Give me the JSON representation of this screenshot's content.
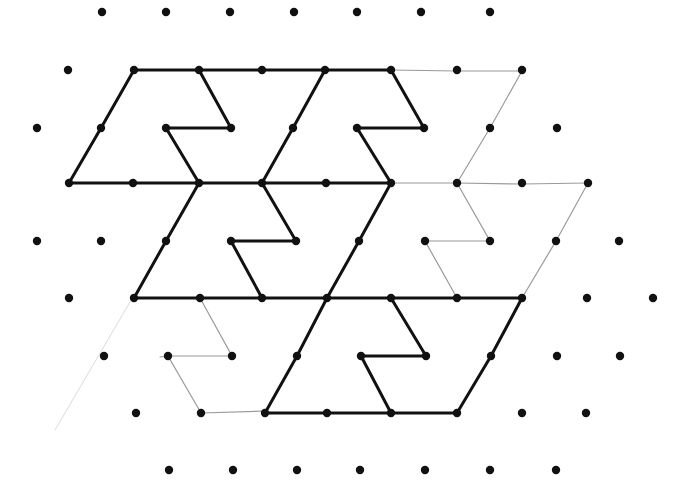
{
  "diagram": {
    "type": "isometric-dot-grid-tessellation",
    "background": "#ffffff",
    "colors": {
      "dot": "#111111",
      "bold_line": "#111111",
      "pencil_line": "#9a9a9a",
      "faint_line": "#dcdcdc"
    },
    "dot_radius": 4.2,
    "grid_rows": [
      {
        "y": 12,
        "x": [
          102,
          166,
          230,
          294,
          357,
          421,
          490
        ]
      },
      {
        "y": 70,
        "x": [
          68,
          134,
          199,
          262,
          325,
          391,
          457,
          522
        ]
      },
      {
        "y": 128,
        "x": [
          37,
          101,
          166,
          231,
          293,
          357,
          424,
          490,
          557
        ]
      },
      {
        "y": 183,
        "x": [
          69,
          133,
          199,
          262,
          326,
          391,
          457,
          522,
          588
        ]
      },
      {
        "y": 241,
        "x": [
          37,
          101,
          166,
          231,
          296,
          359,
          425,
          490,
          556,
          619
        ]
      },
      {
        "y": 298,
        "x": [
          69,
          134,
          200,
          262,
          327,
          391,
          457,
          522,
          587,
          653
        ]
      },
      {
        "y": 356,
        "x": [
          104,
          168,
          232,
          297,
          361,
          426,
          491,
          557,
          620
        ]
      },
      {
        "y": 413,
        "x": [
          136,
          201,
          265,
          327,
          391,
          457,
          522,
          586
        ]
      },
      {
        "y": 470,
        "x": [
          169,
          233,
          297,
          360,
          425,
          490,
          556
        ]
      }
    ],
    "bold_polylines": [
      {
        "name": "top-row-line",
        "points": [
          [
            134,
            70
          ],
          [
            391,
            70
          ]
        ]
      },
      {
        "name": "tile1-left-edge",
        "points": [
          [
            134,
            70
          ],
          [
            101,
            128
          ],
          [
            69,
            183
          ]
        ]
      },
      {
        "name": "tile1-notch",
        "points": [
          [
            199,
            70
          ],
          [
            231,
            128
          ],
          [
            166,
            128
          ],
          [
            199,
            183
          ]
        ]
      },
      {
        "name": "tile2-left-edge",
        "points": [
          [
            325,
            70
          ],
          [
            293,
            128
          ],
          [
            262,
            183
          ]
        ]
      },
      {
        "name": "tile2-notch",
        "points": [
          [
            391,
            70
          ],
          [
            424,
            128
          ],
          [
            357,
            128
          ],
          [
            391,
            183
          ]
        ]
      },
      {
        "name": "middle-row-line",
        "points": [
          [
            69,
            183
          ],
          [
            391,
            183
          ]
        ]
      },
      {
        "name": "tile3-left-edge",
        "points": [
          [
            199,
            183
          ],
          [
            166,
            241
          ],
          [
            134,
            298
          ]
        ]
      },
      {
        "name": "tile3-notch",
        "points": [
          [
            262,
            183
          ],
          [
            296,
            241
          ],
          [
            231,
            241
          ],
          [
            262,
            298
          ]
        ]
      },
      {
        "name": "tile4-left-edge",
        "points": [
          [
            391,
            183
          ],
          [
            359,
            241
          ],
          [
            327,
            298
          ]
        ]
      },
      {
        "name": "lower-row-line",
        "points": [
          [
            134,
            298
          ],
          [
            522,
            298
          ]
        ]
      },
      {
        "name": "tile5-left-edge",
        "points": [
          [
            327,
            298
          ],
          [
            297,
            356
          ],
          [
            265,
            413
          ]
        ]
      },
      {
        "name": "tile5-notch",
        "points": [
          [
            391,
            298
          ],
          [
            426,
            356
          ],
          [
            361,
            356
          ],
          [
            391,
            413
          ]
        ]
      },
      {
        "name": "tile5-right-edge",
        "points": [
          [
            522,
            298
          ],
          [
            491,
            356
          ],
          [
            457,
            413
          ]
        ]
      },
      {
        "name": "bottom-row-line",
        "points": [
          [
            265,
            413
          ],
          [
            457,
            413
          ]
        ]
      }
    ],
    "pencil_polylines": [
      {
        "name": "pencil-top-extension",
        "points": [
          [
            391,
            70
          ],
          [
            457,
            71
          ],
          [
            522,
            71
          ]
        ]
      },
      {
        "name": "pencil-right-edge-upper",
        "points": [
          [
            522,
            71
          ],
          [
            490,
            128
          ],
          [
            457,
            183
          ]
        ]
      },
      {
        "name": "pencil-middle-extension",
        "points": [
          [
            391,
            183
          ],
          [
            457,
            183
          ],
          [
            522,
            184
          ],
          [
            588,
            183
          ]
        ]
      },
      {
        "name": "pencil-notch-right",
        "points": [
          [
            457,
            183
          ],
          [
            490,
            241
          ],
          [
            425,
            241
          ],
          [
            457,
            298
          ]
        ]
      },
      {
        "name": "pencil-right-edge-lower",
        "points": [
          [
            588,
            183
          ],
          [
            556,
            241
          ],
          [
            522,
            298
          ]
        ]
      },
      {
        "name": "pencil-lower-left-notch",
        "points": [
          [
            200,
            298
          ],
          [
            232,
            356
          ],
          [
            168,
            356
          ],
          [
            201,
            413
          ],
          [
            265,
            411
          ]
        ]
      },
      {
        "name": "pencil-stub-left",
        "points": [
          [
            160,
            357
          ],
          [
            168,
            356
          ]
        ]
      }
    ],
    "faint_polylines": [
      {
        "name": "faint-diagonal-left",
        "points": [
          [
            130,
            302
          ],
          [
            55,
            430
          ]
        ]
      }
    ]
  }
}
